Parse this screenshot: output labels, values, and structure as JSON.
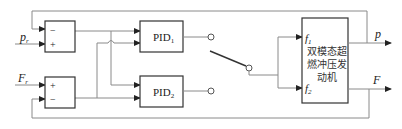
{
  "diagram": {
    "type": "block-diagram",
    "inputs": {
      "p_ref": {
        "main": "p",
        "sub": "r"
      },
      "F_ref": {
        "main": "F",
        "sub": "r"
      }
    },
    "summers": [
      {
        "id": "sum1",
        "signs": {
          "top": "−",
          "bottom": "+"
        }
      },
      {
        "id": "sum2",
        "signs": {
          "top": "+",
          "bottom": "−"
        }
      }
    ],
    "controllers": [
      {
        "id": "pid1",
        "main": "PID",
        "sub": "1"
      },
      {
        "id": "pid2",
        "main": "PID",
        "sub": "2"
      }
    ],
    "switch": {
      "contacts": [
        "PID1 output",
        "PID2 output"
      ],
      "state": "toggle"
    },
    "plant": {
      "title_lines": [
        "双模态超",
        "燃冲压发",
        "动机"
      ],
      "inputs": [
        {
          "main": "f",
          "sub": "1"
        },
        {
          "main": "f",
          "sub": "2"
        }
      ]
    },
    "outputs": [
      {
        "label": "p"
      },
      {
        "label": "F"
      }
    ],
    "colors": {
      "wire": "#8a8a8a",
      "box": "#333333"
    }
  }
}
